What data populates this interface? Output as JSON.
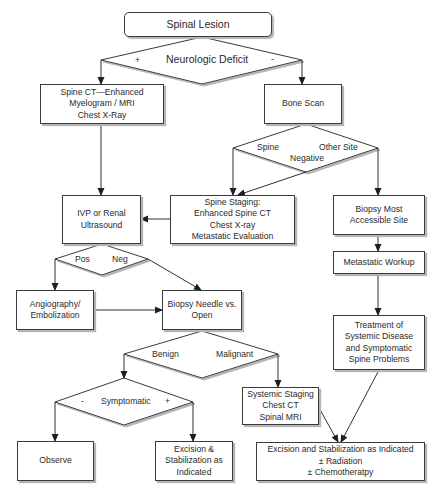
{
  "diagram": {
    "type": "flowchart",
    "nodes": {
      "spinal_lesion": "Spinal Lesion",
      "neurologic_deficit": "Neurologic Deficit",
      "spine_ct": "Spine CT—Enhanced\nMyelogram / MRI\nChest X-Ray",
      "bone_scan": "Bone Scan",
      "ivp": "IVP or  Renal\nUltrasound",
      "spine_staging": "Spine Staging:\nEnhanced  Spine CT\nChest X-ray\nMetastatic Evaluation",
      "biopsy_most": "Biopsy Most\nAccessible Site",
      "metastatic_workup": "Metastatic Workup",
      "angiography": "Angiography/\nEmbolization",
      "biopsy_needle": "Biopsy Needle vs.\nOpen",
      "treatment": "Treatment of\nSystemic Disease\nand Symptomatic\nSpine Problems",
      "systemic_staging": "Systemic Staging\nChest CT\nSpinal MRI",
      "observe": "Observe",
      "excision_small": "Excision &\nStabilization as\nIndicated",
      "excision_large": "Excision and Stabilization as Indicated\n± Radiation\n± Chemotheratpy"
    },
    "decisions": {
      "neuro_plus": "+",
      "neuro_minus": "-",
      "bone_spine": "Spine",
      "bone_other": "Other Site",
      "bone_negative": "Negative",
      "pos": "Pos",
      "neg": "Neg",
      "benign": "Benign",
      "malignant": "Malignant",
      "symptomatic": "Symptomatic",
      "sym_minus": "-",
      "sym_plus": "+"
    },
    "edges": [
      {
        "from": "Spinal Lesion",
        "to": "Neurologic Deficit"
      },
      {
        "from": "Neurologic Deficit",
        "label": "+",
        "to": "Spine CT—Enhanced Myelogram / MRI Chest X-Ray"
      },
      {
        "from": "Neurologic Deficit",
        "label": "-",
        "to": "Bone Scan"
      },
      {
        "from": "Spine CT",
        "to": "IVP or Renal Ultrasound"
      },
      {
        "from": "Bone Scan",
        "to": "Spine / Other Site / Negative decision"
      },
      {
        "from": "Bone Scan decision",
        "label": "Spine",
        "to": "Spine Staging"
      },
      {
        "from": "Bone Scan decision",
        "label": "Negative",
        "to": "Spine Staging"
      },
      {
        "from": "Bone Scan decision",
        "label": "Other Site",
        "to": "Biopsy Most Accessible Site"
      },
      {
        "from": "Spine Staging",
        "to": "IVP or Renal Ultrasound"
      },
      {
        "from": "IVP or Renal Ultrasound",
        "to": "Pos / Neg decision"
      },
      {
        "from": "Pos / Neg decision",
        "label": "Pos",
        "to": "Angiography/Embolization"
      },
      {
        "from": "Pos / Neg decision",
        "label": "Neg",
        "to": "Biopsy Needle vs. Open"
      },
      {
        "from": "Angiography/Embolization",
        "to": "Biopsy Needle vs. Open"
      },
      {
        "from": "Biopsy Needle vs. Open",
        "to": "Benign / Malignant decision"
      },
      {
        "from": "Benign / Malignant decision",
        "label": "Benign",
        "to": "Symptomatic decision"
      },
      {
        "from": "Benign / Malignant decision",
        "label": "Malignant",
        "to": "Systemic Staging"
      },
      {
        "from": "Symptomatic decision",
        "label": "-",
        "to": "Observe"
      },
      {
        "from": "Symptomatic decision",
        "label": "+",
        "to": "Excision & Stabilization as Indicated"
      },
      {
        "from": "Biopsy Most Accessible Site",
        "to": "Metastatic Workup"
      },
      {
        "from": "Metastatic Workup",
        "to": "Treatment of Systemic Disease and Symptomatic Spine Problems"
      },
      {
        "from": "Treatment of Systemic Disease",
        "to": "Excision and Stabilization as Indicated ± Radiation ± Chemotheratpy"
      },
      {
        "from": "Systemic Staging",
        "to": "Excision and Stabilization as Indicated ± Radiation ± Chemotheratpy"
      }
    ]
  },
  "colors": {
    "line": "#2f2f2f",
    "box_border": "#3a3a3a",
    "shadow": "#b5b5b5",
    "background": "#ffffff"
  }
}
